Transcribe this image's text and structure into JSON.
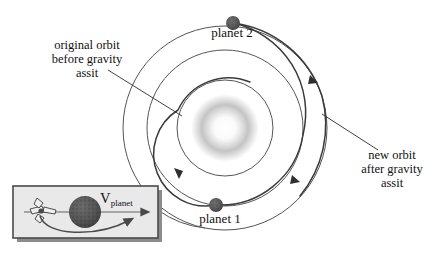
{
  "figure": {
    "background_color": "#ffffff",
    "ink_color": "#2b2b2b"
  },
  "labels": {
    "original_orbit": "original orbit\nbefore gravity\nassit",
    "new_orbit": "new orbit\nafter gravity\nassit",
    "planet_2": "planet 2",
    "planet_1": "planet 1",
    "v_planet_symbol": "V",
    "v_planet_subscript": "planet"
  },
  "colors": {
    "orbit_line": "#4a4a4a",
    "trajectory_line": "#3a3a3a",
    "planet_dot": "#585858",
    "sun_glow": "#b9b9b9",
    "inset_fill": "#e8e8e8",
    "inset_border": "#4a4a4a",
    "inset_shadow": "#8c8c8c",
    "leader_line": "#2b2b2b"
  },
  "diagram": {
    "sun": {
      "cx": 225,
      "cy": 128,
      "radius": 26,
      "name": "sun"
    },
    "orbits": [
      {
        "name": "planet-1-orbit",
        "cx": 225,
        "cy": 128,
        "radius": 48
      },
      {
        "name": "middle-orbit",
        "cx": 225,
        "cy": 128,
        "radius": 78
      },
      {
        "name": "planet-2-orbit",
        "cx": 225,
        "cy": 128,
        "radius": 102
      }
    ],
    "planets": [
      {
        "name": "planet-2",
        "cx": 233,
        "cy": 23,
        "radius": 7
      },
      {
        "name": "planet-1",
        "cx": 216,
        "cy": 205,
        "radius": 7
      }
    ],
    "arrow_markers": [
      {
        "name": "inner-trajectory-arrow",
        "x": 176,
        "y": 174
      },
      {
        "name": "outer-trajectory-arrow",
        "x": 296,
        "y": 180
      },
      {
        "name": "upper-trajectory-arrow",
        "x": 314,
        "y": 80
      }
    ]
  },
  "inset": {
    "name": "gravity-assist-detail-inset",
    "box": {
      "x": 13,
      "y": 186,
      "width": 145,
      "height": 52
    },
    "spacecraft": {
      "name": "spacecraft",
      "x": 38,
      "y": 212
    },
    "planet": {
      "name": "inset-planet",
      "cx": 85,
      "cy": 212,
      "radius": 16
    },
    "velocity_arrow": {
      "name": "v-planet-arrow",
      "x1": 24,
      "y1": 212,
      "x2": 147,
      "y2": 212
    },
    "flyby_path": {
      "name": "flyby-trajectory"
    }
  }
}
